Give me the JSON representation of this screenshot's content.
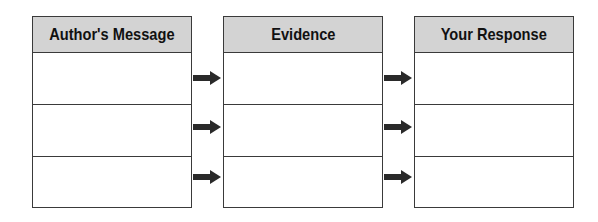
{
  "diagram": {
    "columns": [
      {
        "header": "Author's Message",
        "rows": [
          "",
          "",
          ""
        ]
      },
      {
        "header": "Evidence",
        "rows": [
          "",
          "",
          ""
        ]
      },
      {
        "header": "Your Response",
        "rows": [
          "",
          "",
          ""
        ]
      }
    ],
    "connectors": [
      {
        "from": "Author's Message",
        "to": "Evidence",
        "count": 3,
        "icon": "right-arrow-icon"
      },
      {
        "from": "Evidence",
        "to": "Your Response",
        "count": 3,
        "icon": "right-arrow-icon"
      }
    ],
    "colors": {
      "header_fill": "#d3d3d3",
      "border": "#3a3a3a",
      "arrow": "#2a2a2a"
    }
  }
}
